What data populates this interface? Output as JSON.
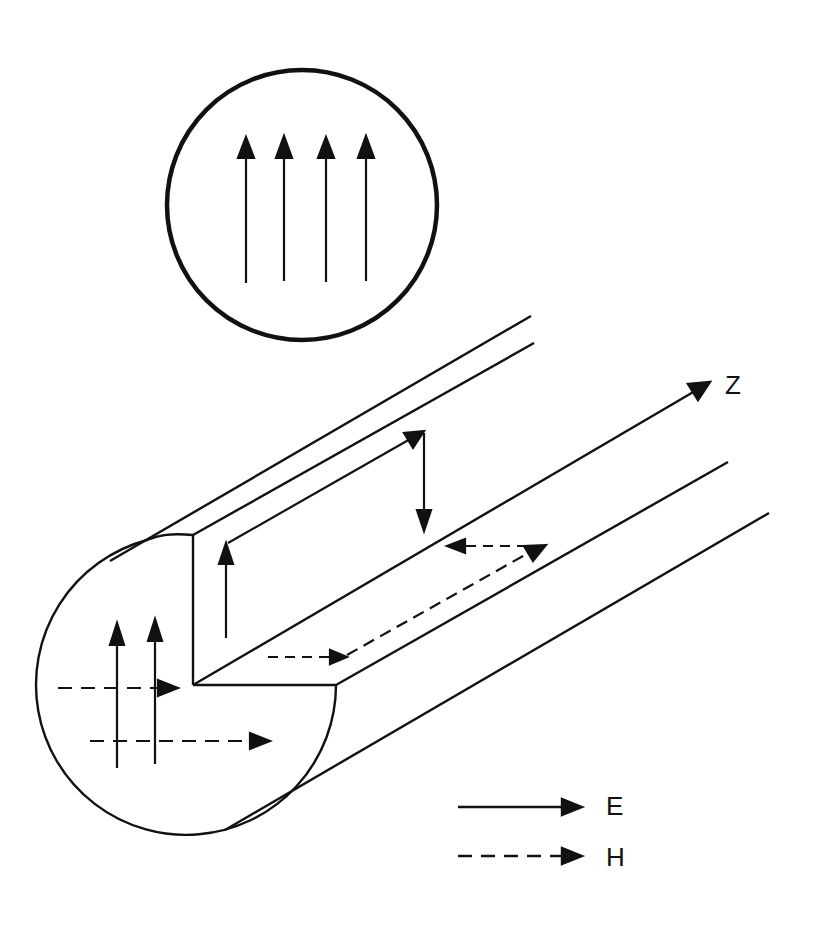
{
  "diagram": {
    "axis_label": "Z",
    "legend": [
      {
        "symbol": "solid-arrow",
        "label": "E"
      },
      {
        "symbol": "dashed-arrow",
        "label": "H"
      }
    ],
    "colors": {
      "stroke": "#111111",
      "background": "#ffffff"
    },
    "inset": {
      "description": "Circular cross-section with four parallel upward E-field arrows",
      "arrow_count": 4
    },
    "cross_section": {
      "e_arrows_up": 2,
      "h_arrows_right": 2
    }
  }
}
